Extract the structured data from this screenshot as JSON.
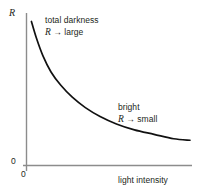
{
  "chart_data": {
    "type": "line",
    "title": "",
    "subtitle": "",
    "xlabel": "light intensity",
    "ylabel": "R",
    "xlim": [
      0,
      1
    ],
    "ylim": [
      0,
      1
    ],
    "grid": false,
    "legend": null,
    "axis_origin_label_y": "0",
    "axis_origin_label_x": "0",
    "series": [
      {
        "name": "resistance vs light intensity",
        "color": "#111111",
        "x": [
          0.03,
          0.06,
          0.1,
          0.15,
          0.21,
          0.28,
          0.36,
          0.45,
          0.55,
          0.66,
          0.78,
          0.9,
          1.0
        ],
        "y": [
          0.97,
          0.86,
          0.74,
          0.63,
          0.54,
          0.46,
          0.39,
          0.33,
          0.28,
          0.24,
          0.21,
          0.18,
          0.17
        ]
      }
    ],
    "annotations": [
      {
        "id": "total-darkness",
        "line1": "total darkness",
        "symbol": "R",
        "line2_rest": " → large",
        "x": 0.12,
        "y": 0.93
      },
      {
        "id": "bright",
        "line1": "bright",
        "symbol": "R",
        "line2_rest": " → small",
        "x": 0.58,
        "y": 0.4
      }
    ],
    "colors": {
      "curve": "#111111",
      "axis": "#8c8c8c",
      "text": "#231f20",
      "background": "#ffffff"
    }
  },
  "figure": {
    "y_axis_symbol": "R",
    "x_axis_title": "light intensity",
    "origin_y_tick": "0",
    "origin_x_tick": "0",
    "annotation_dark_line1": "total darkness",
    "annotation_dark_symbol": "R",
    "annotation_dark_line2": " → large",
    "annotation_bright_line1": "bright",
    "annotation_bright_symbol": "R",
    "annotation_bright_line2": " → small"
  }
}
